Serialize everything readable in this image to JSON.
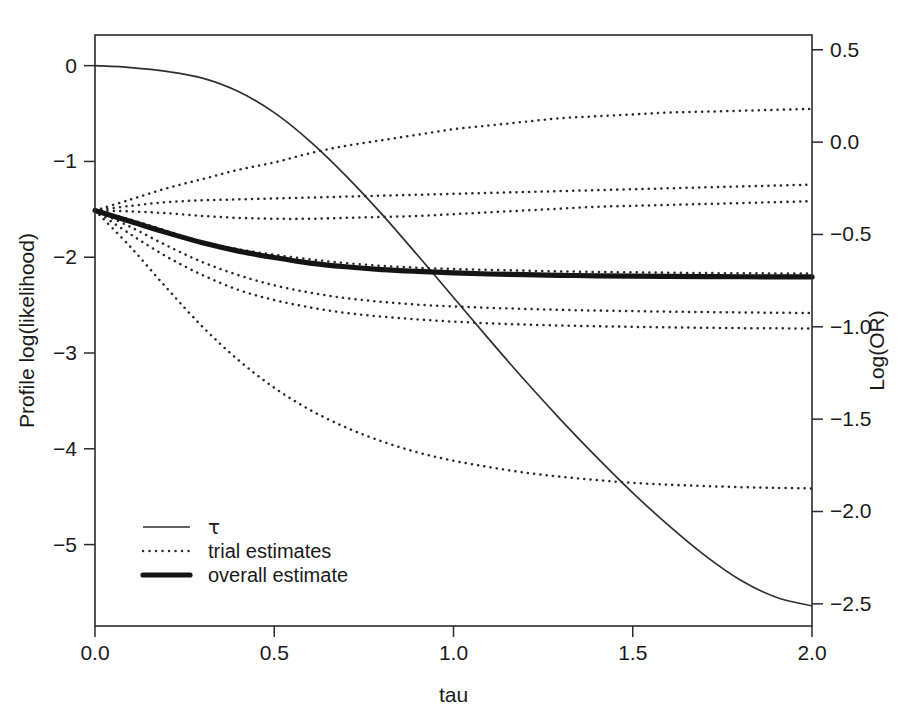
{
  "chart_data": {
    "type": "line",
    "title": "",
    "xlabel": "tau",
    "ylabel": "Profile log(likelihood)",
    "y2label": "Log(OR)",
    "xlim": [
      0.0,
      2.0
    ],
    "ylim": [
      -5.85,
      0.32
    ],
    "y2lim": [
      -2.62,
      0.58
    ],
    "grid": false,
    "legend_position": "bottom-left",
    "background_color": "#ffffff",
    "line_color": "#1a1a1a",
    "xticks": [
      0.0,
      0.5,
      1.0,
      1.5,
      2.0
    ],
    "xticklabels": [
      "0.0",
      "0.5",
      "1.0",
      "1.5",
      "2.0"
    ],
    "yticks": [
      0,
      -1,
      -2,
      -3,
      -4,
      -5
    ],
    "yticklabels": [
      "0",
      "-1",
      "-2",
      "-3",
      "-4",
      "-5"
    ],
    "y2ticks": [
      0.5,
      0.0,
      -0.5,
      -1.0,
      -1.5,
      -2.0,
      -2.5
    ],
    "y2ticklabels": [
      "0.5",
      "0.0",
      "-0.5",
      "-1.0",
      "-1.5",
      "-2.0",
      "-2.5"
    ],
    "legend": [
      {
        "label": "τ",
        "style": "solid-thin",
        "axis": "left",
        "greek": true
      },
      {
        "label": "trial estimates",
        "style": "dotted",
        "axis": "right",
        "greek": false
      },
      {
        "label": "overall estimate",
        "style": "solid-thick",
        "axis": "right",
        "greek": false
      }
    ],
    "x": [
      0.0,
      0.1,
      0.2,
      0.3,
      0.4,
      0.5,
      0.6,
      0.7,
      0.8,
      0.9,
      1.0,
      1.1,
      1.2,
      1.3,
      1.4,
      1.5,
      1.6,
      1.7,
      1.8,
      1.9,
      2.0
    ],
    "series": [
      {
        "name": "tau",
        "axis": "left",
        "style": "solid-thin",
        "values": [
          0.0,
          -0.02,
          -0.06,
          -0.13,
          -0.27,
          -0.49,
          -0.79,
          -1.15,
          -1.55,
          -1.98,
          -2.42,
          -2.86,
          -3.29,
          -3.7,
          -4.09,
          -4.46,
          -4.8,
          -5.11,
          -5.37,
          -5.55,
          -5.64
        ]
      },
      {
        "name": "trial estimate 1",
        "axis": "right",
        "style": "dotted",
        "values": [
          -0.37,
          -0.31,
          -0.25,
          -0.2,
          -0.15,
          -0.11,
          -0.06,
          -0.02,
          0.01,
          0.04,
          0.07,
          0.09,
          0.11,
          0.13,
          0.14,
          0.15,
          0.16,
          0.165,
          0.17,
          0.175,
          0.18
        ]
      },
      {
        "name": "trial estimate 2",
        "axis": "right",
        "style": "dotted",
        "values": [
          -0.37,
          -0.345,
          -0.325,
          -0.315,
          -0.31,
          -0.305,
          -0.3,
          -0.295,
          -0.29,
          -0.285,
          -0.28,
          -0.275,
          -0.27,
          -0.265,
          -0.26,
          -0.255,
          -0.25,
          -0.245,
          -0.24,
          -0.235,
          -0.23
        ]
      },
      {
        "name": "trial estimate 3",
        "axis": "right",
        "style": "dotted",
        "values": [
          -0.37,
          -0.375,
          -0.385,
          -0.4,
          -0.41,
          -0.415,
          -0.415,
          -0.41,
          -0.405,
          -0.4,
          -0.39,
          -0.38,
          -0.37,
          -0.36,
          -0.35,
          -0.345,
          -0.34,
          -0.335,
          -0.33,
          -0.325,
          -0.32
        ]
      },
      {
        "name": "trial estimate 4",
        "axis": "right",
        "style": "dotted",
        "values": [
          -0.37,
          -0.42,
          -0.48,
          -0.54,
          -0.58,
          -0.61,
          -0.635,
          -0.655,
          -0.67,
          -0.68,
          -0.687,
          -0.692,
          -0.696,
          -0.7,
          -0.703,
          -0.705,
          -0.707,
          -0.709,
          -0.71,
          -0.711,
          -0.712
        ]
      },
      {
        "name": "trial estimate 5",
        "axis": "right",
        "style": "dotted",
        "values": [
          -0.37,
          -0.46,
          -0.56,
          -0.65,
          -0.72,
          -0.775,
          -0.815,
          -0.845,
          -0.865,
          -0.88,
          -0.89,
          -0.897,
          -0.903,
          -0.908,
          -0.912,
          -0.915,
          -0.918,
          -0.92,
          -0.922,
          -0.924,
          -0.925
        ]
      },
      {
        "name": "trial estimate 6",
        "axis": "right",
        "style": "dotted",
        "values": [
          -0.37,
          -0.5,
          -0.62,
          -0.72,
          -0.8,
          -0.855,
          -0.895,
          -0.925,
          -0.945,
          -0.96,
          -0.972,
          -0.981,
          -0.988,
          -0.993,
          -0.997,
          -1.0,
          -1.003,
          -1.005,
          -1.007,
          -1.008,
          -1.01
        ]
      },
      {
        "name": "trial estimate 7",
        "axis": "right",
        "style": "dotted",
        "values": [
          -0.37,
          -0.57,
          -0.79,
          -1.0,
          -1.18,
          -1.33,
          -1.45,
          -1.545,
          -1.62,
          -1.68,
          -1.725,
          -1.76,
          -1.79,
          -1.812,
          -1.83,
          -1.845,
          -1.855,
          -1.862,
          -1.868,
          -1.872,
          -1.875
        ]
      },
      {
        "name": "overall estimate",
        "axis": "right",
        "style": "solid-thick",
        "values": [
          -0.37,
          -0.43,
          -0.49,
          -0.545,
          -0.59,
          -0.625,
          -0.655,
          -0.675,
          -0.69,
          -0.7,
          -0.708,
          -0.714,
          -0.718,
          -0.721,
          -0.724,
          -0.726,
          -0.727,
          -0.728,
          -0.729,
          -0.7295,
          -0.73
        ]
      }
    ]
  },
  "layout": {
    "plot_left": 95,
    "plot_right": 812,
    "plot_top": 35,
    "plot_bottom": 626,
    "legend_x": 143,
    "legend_line_end": 190,
    "legend_text_x": 208,
    "legend_rows_y": [
      527,
      551,
      575
    ]
  }
}
